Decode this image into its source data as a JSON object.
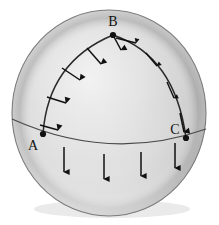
{
  "figure": {
    "background_color": "#ffffff",
    "sphere": {
      "fill_light": "#e9e9e9",
      "fill_mid": "#d2d2d2",
      "fill_dark": "#8c8c8c",
      "outline_color": "#6d6d6d",
      "center_x": 109,
      "center_y": 113,
      "radius_x": 97,
      "radius_y": 103
    },
    "curve_color": "#2a2a2a",
    "arrow_color": "#111111",
    "vertices": [
      {
        "id": "A",
        "label": "A",
        "dot_x": 43,
        "dot_y": 134,
        "label_x": 33,
        "label_y": 148
      },
      {
        "id": "B",
        "label": "B",
        "dot_x": 113,
        "dot_y": 35,
        "label_x": 113,
        "label_y": 27
      },
      {
        "id": "C",
        "label": "C",
        "dot_x": 186,
        "dot_y": 138,
        "label_x": 175,
        "label_y": 132
      }
    ],
    "arcs": [
      {
        "name": "arc-a-to-b",
        "from": "A",
        "to": "B"
      },
      {
        "name": "arc-b-to-c",
        "from": "B",
        "to": "C"
      },
      {
        "name": "equator-arc",
        "from": "left-limb",
        "to": "right-limb"
      }
    ],
    "vector_field": {
      "description": "arrows normal to the path, transported around the closed triangle",
      "count_arc_ab": 4,
      "count_arc_bc": 3,
      "count_equator": 4
    }
  }
}
